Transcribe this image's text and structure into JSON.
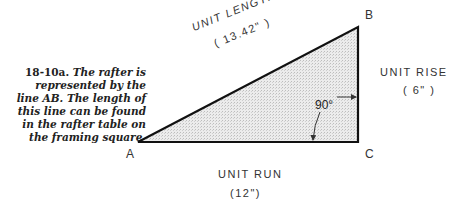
{
  "caption": {
    "figure_number": "18-10a.",
    "text": "The rafter is represented by the line AB. The length of this line can be found in the rafter table on the framing square."
  },
  "triangle": {
    "vertices": {
      "A": "A",
      "B": "B",
      "C": "C"
    },
    "fill": "#e6e6e6",
    "stroke": "#111111"
  },
  "labels": {
    "hypotenuse_title": "UNIT LENGTH",
    "hypotenuse_value": "( 13.42\" )",
    "rise_title": "UNIT RISE",
    "rise_value": "( 6\" )",
    "run_title": "UNIT RUN",
    "run_value": "(12\")",
    "angle": "90°"
  }
}
